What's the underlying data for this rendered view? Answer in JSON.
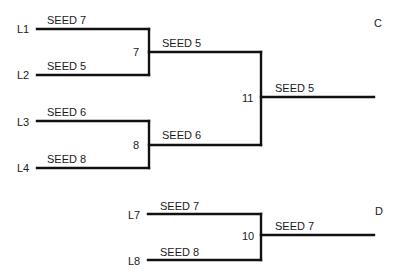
{
  "diagram": {
    "type": "tournament-bracket",
    "brackets": [
      {
        "id": "C",
        "label": "C",
        "rounds": [
          {
            "game": "7",
            "entries": [
              {
                "line": "L1",
                "team": "SEED 7"
              },
              {
                "line": "L2",
                "team": "SEED 5"
              }
            ],
            "winner": "SEED 5"
          },
          {
            "game": "8",
            "entries": [
              {
                "line": "L3",
                "team": "SEED 6"
              },
              {
                "line": "L4",
                "team": "SEED 8"
              }
            ],
            "winner": "SEED 6"
          },
          {
            "game": "11",
            "entries": [
              {
                "from_game": "7",
                "team": "SEED 5"
              },
              {
                "from_game": "8",
                "team": "SEED 6"
              }
            ],
            "winner": "SEED 5"
          }
        ]
      },
      {
        "id": "D",
        "label": "D",
        "rounds": [
          {
            "game": "10",
            "entries": [
              {
                "line": "L7",
                "team": "SEED 7"
              },
              {
                "line": "L8",
                "team": "SEED 8"
              }
            ],
            "winner": "SEED 7"
          }
        ]
      }
    ]
  },
  "labels": {
    "L1": "L1",
    "L2": "L2",
    "L3": "L3",
    "L4": "L4",
    "L7": "L7",
    "L8": "L8",
    "g7": "7",
    "g8": "8",
    "g11": "11",
    "g10": "10",
    "C": "C",
    "D": "D",
    "l1_team": "SEED 7",
    "l2_team": "SEED 5",
    "l3_team": "SEED 6",
    "l4_team": "SEED 8",
    "g7_winner": "SEED 5",
    "g8_winner": "SEED 6",
    "g11_winner": "SEED 5",
    "l7_team": "SEED 7",
    "l8_team": "SEED 8",
    "g10_winner": "SEED 7"
  }
}
